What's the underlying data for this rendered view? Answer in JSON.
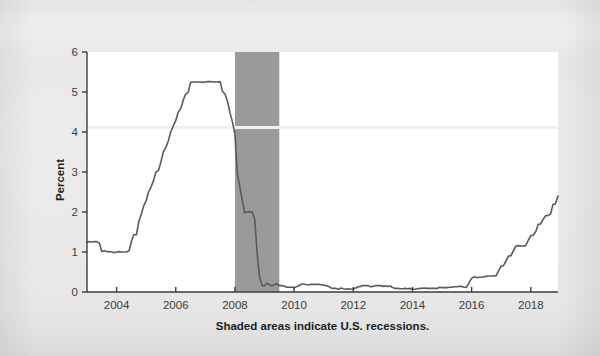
{
  "figure": {
    "background_color": "#e9e9e9",
    "plot_background_color": "#ffffff",
    "footnote": "Shaded areas indicate U.S. recessions."
  },
  "chart_data": {
    "type": "line",
    "title": "",
    "subtitle": "",
    "xlabel": "",
    "ylabel": "Percent",
    "xlim": [
      2003.0,
      2018.92
    ],
    "ylim": [
      0,
      6
    ],
    "grid": false,
    "legend": null,
    "line_color": "#5a5a5a",
    "line_width": 1.6,
    "axis_color": "#3c3c3c",
    "xticks": [
      2004,
      2006,
      2008,
      2010,
      2012,
      2014,
      2016,
      2018
    ],
    "xtick_labels": [
      "2004",
      "2006",
      "2008",
      "2010",
      "2012",
      "2014",
      "2016",
      "2018"
    ],
    "yticks": [
      0,
      1,
      2,
      3,
      4,
      5,
      6
    ],
    "ytick_labels": [
      "0",
      "1",
      "2",
      "3",
      "4",
      "5",
      "6"
    ],
    "shaded_regions": [
      {
        "label": "U.S. recession",
        "x_start": 2008.0,
        "x_end": 2009.5,
        "color": "#9a9a9a"
      }
    ],
    "series": [
      {
        "name": "Effective Federal Funds Rate",
        "x": [
          2003.0,
          2003.08,
          2003.17,
          2003.25,
          2003.33,
          2003.42,
          2003.5,
          2003.58,
          2003.67,
          2003.75,
          2003.83,
          2003.92,
          2004.0,
          2004.08,
          2004.17,
          2004.25,
          2004.33,
          2004.42,
          2004.5,
          2004.58,
          2004.67,
          2004.75,
          2004.83,
          2004.92,
          2005.0,
          2005.08,
          2005.17,
          2005.25,
          2005.33,
          2005.42,
          2005.5,
          2005.58,
          2005.67,
          2005.75,
          2005.83,
          2005.92,
          2006.0,
          2006.08,
          2006.17,
          2006.25,
          2006.33,
          2006.42,
          2006.5,
          2006.58,
          2006.67,
          2006.75,
          2006.83,
          2006.92,
          2007.0,
          2007.08,
          2007.17,
          2007.25,
          2007.33,
          2007.42,
          2007.5,
          2007.58,
          2007.67,
          2007.75,
          2007.83,
          2007.92,
          2008.0,
          2008.08,
          2008.17,
          2008.25,
          2008.33,
          2008.42,
          2008.5,
          2008.58,
          2008.67,
          2008.75,
          2008.83,
          2008.92,
          2009.0,
          2009.08,
          2009.17,
          2009.25,
          2009.33,
          2009.42,
          2009.5,
          2009.58,
          2009.67,
          2009.75,
          2009.83,
          2009.92,
          2010.0,
          2010.08,
          2010.17,
          2010.25,
          2010.33,
          2010.42,
          2010.5,
          2010.58,
          2010.67,
          2010.75,
          2010.83,
          2010.92,
          2011.0,
          2011.08,
          2011.17,
          2011.25,
          2011.33,
          2011.42,
          2011.5,
          2011.58,
          2011.67,
          2011.75,
          2011.83,
          2011.92,
          2012.0,
          2012.08,
          2012.17,
          2012.25,
          2012.33,
          2012.42,
          2012.5,
          2012.58,
          2012.67,
          2012.75,
          2012.83,
          2012.92,
          2013.0,
          2013.08,
          2013.17,
          2013.25,
          2013.33,
          2013.42,
          2013.5,
          2013.58,
          2013.67,
          2013.75,
          2013.83,
          2013.92,
          2014.0,
          2014.08,
          2014.17,
          2014.25,
          2014.33,
          2014.42,
          2014.5,
          2014.58,
          2014.67,
          2014.75,
          2014.83,
          2014.92,
          2015.0,
          2015.08,
          2015.17,
          2015.25,
          2015.33,
          2015.42,
          2015.5,
          2015.58,
          2015.67,
          2015.75,
          2015.83,
          2015.92,
          2016.0,
          2016.08,
          2016.17,
          2016.25,
          2016.33,
          2016.42,
          2016.5,
          2016.58,
          2016.67,
          2016.75,
          2016.83,
          2016.92,
          2017.0,
          2017.08,
          2017.17,
          2017.25,
          2017.33,
          2017.42,
          2017.5,
          2017.58,
          2017.67,
          2017.75,
          2017.83,
          2017.92,
          2018.0,
          2018.08,
          2018.17,
          2018.25,
          2018.33,
          2018.42,
          2018.5,
          2018.58,
          2018.67,
          2018.75,
          2018.83,
          2018.92
        ],
        "y": [
          1.24,
          1.26,
          1.25,
          1.26,
          1.26,
          1.22,
          1.01,
          1.03,
          1.01,
          1.01,
          1.0,
          0.98,
          1.0,
          1.01,
          1.0,
          1.0,
          1.0,
          1.03,
          1.26,
          1.43,
          1.43,
          1.76,
          1.93,
          2.16,
          2.28,
          2.5,
          2.63,
          2.79,
          3.0,
          3.04,
          3.26,
          3.5,
          3.62,
          3.78,
          4.0,
          4.16,
          4.29,
          4.49,
          4.59,
          4.79,
          4.94,
          4.99,
          5.24,
          5.25,
          5.25,
          5.25,
          5.25,
          5.24,
          5.25,
          5.26,
          5.26,
          5.25,
          5.25,
          5.25,
          5.26,
          5.02,
          4.94,
          4.76,
          4.49,
          4.24,
          3.94,
          2.98,
          2.61,
          2.28,
          1.98,
          2.0,
          2.01,
          2.0,
          1.81,
          0.97,
          0.39,
          0.16,
          0.15,
          0.22,
          0.18,
          0.15,
          0.18,
          0.21,
          0.16,
          0.16,
          0.15,
          0.12,
          0.12,
          0.12,
          0.11,
          0.13,
          0.16,
          0.2,
          0.2,
          0.18,
          0.18,
          0.19,
          0.19,
          0.19,
          0.19,
          0.18,
          0.17,
          0.16,
          0.14,
          0.1,
          0.09,
          0.09,
          0.07,
          0.1,
          0.08,
          0.07,
          0.08,
          0.07,
          0.08,
          0.1,
          0.13,
          0.14,
          0.16,
          0.16,
          0.16,
          0.13,
          0.14,
          0.16,
          0.16,
          0.16,
          0.14,
          0.15,
          0.14,
          0.15,
          0.11,
          0.09,
          0.09,
          0.08,
          0.08,
          0.09,
          0.08,
          0.09,
          0.07,
          0.07,
          0.08,
          0.09,
          0.09,
          0.1,
          0.09,
          0.09,
          0.09,
          0.09,
          0.09,
          0.12,
          0.11,
          0.11,
          0.11,
          0.12,
          0.12,
          0.13,
          0.13,
          0.14,
          0.14,
          0.12,
          0.12,
          0.24,
          0.34,
          0.38,
          0.36,
          0.37,
          0.37,
          0.38,
          0.39,
          0.4,
          0.4,
          0.4,
          0.41,
          0.54,
          0.65,
          0.66,
          0.79,
          0.9,
          0.91,
          1.04,
          1.15,
          1.16,
          1.15,
          1.15,
          1.16,
          1.3,
          1.41,
          1.42,
          1.51,
          1.69,
          1.7,
          1.82,
          1.91,
          1.91,
          1.95,
          2.19,
          2.2,
          2.4
        ]
      }
    ],
    "annotations": [
      "Shaded areas indicate U.S. recessions."
    ]
  }
}
